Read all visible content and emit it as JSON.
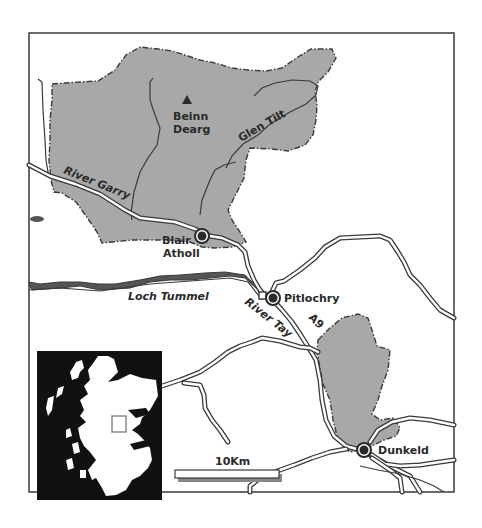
{
  "map": {
    "colors": {
      "background": "#ffffff",
      "frame": "#3a3a3a",
      "shaded_area": "#a8a8a8",
      "boundary": "#3a3a3a",
      "road_outline": "#3a3a3a",
      "road_fill": "#ffffff",
      "river": "#3a3a3a",
      "loch": "#555555",
      "label": "#2a2a2a",
      "inset_sea": "#111111",
      "inset_land": "#ffffff",
      "inset_highlight": "#8a8a8a",
      "scale_bar_fill": "#ffffff",
      "scale_bar_shadow": "#888888"
    },
    "places": [
      {
        "name": "Blair Atholl",
        "line1": "Blair",
        "line2": "Atholl",
        "x": 202,
        "y": 236
      },
      {
        "name": "Pitlochry",
        "line1": "Pitlochry",
        "x": 273,
        "y": 298
      },
      {
        "name": "Dunkeld",
        "line1": "Dunkeld",
        "x": 365,
        "y": 450
      }
    ],
    "peaks": [
      {
        "name": "Beinn Dearg",
        "line1": "Beinn",
        "line2": "Dearg",
        "symbol": "triangle-peak-icon",
        "x": 187,
        "y": 101
      }
    ],
    "features": {
      "glen_tilt": "Glen Tilt",
      "river_garry": "River Garry",
      "river_tay": "River Tay",
      "loch_tummel": "Loch Tummel",
      "road_a9": "A9"
    },
    "scale_bar": {
      "label": "10Km"
    },
    "inset": {
      "description": "Scotland locator map",
      "highlight_icon": "location-box-icon"
    }
  }
}
